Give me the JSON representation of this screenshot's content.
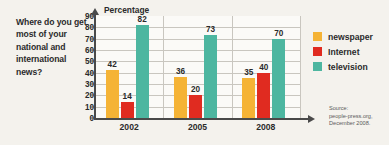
{
  "question": "Where do you get most of your national and international news?",
  "chart_data": {
    "type": "bar",
    "title": "",
    "axis_title": "Percentage",
    "xlabel": "",
    "ylabel": "Percentage",
    "ylim": [
      0,
      90
    ],
    "yticks": [
      0,
      10,
      20,
      30,
      40,
      50,
      60,
      70,
      80,
      90
    ],
    "grid": true,
    "legend_position": "right",
    "categories": [
      "2002",
      "2005",
      "2008"
    ],
    "series": [
      {
        "name": "newspaper",
        "color": "#f5b335",
        "values": [
          42,
          36,
          35
        ]
      },
      {
        "name": "Internet",
        "color": "#e02b20",
        "values": [
          14,
          20,
          40
        ]
      },
      {
        "name": "television",
        "color": "#4db6a0",
        "values": [
          82,
          73,
          70
        ]
      }
    ]
  },
  "legend": [
    {
      "label": "newspaper",
      "color": "#f5b335"
    },
    {
      "label": "Internet",
      "color": "#e02b20"
    },
    {
      "label": "television",
      "color": "#4db6a0"
    }
  ],
  "source": {
    "line1": "Source:",
    "line2": "people-press.org,",
    "line3": "December 2008."
  }
}
